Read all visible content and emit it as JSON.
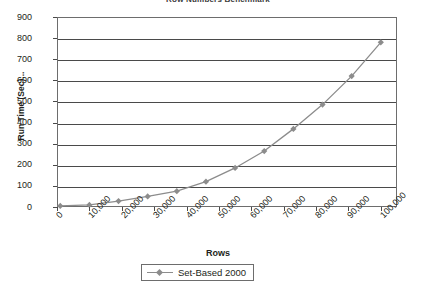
{
  "chart_data": {
    "type": "line",
    "title": "Row Numbers Benchmark",
    "xlabel": "Rows",
    "ylabel": "Run Time (Sec)...",
    "xlim": [
      0,
      105000
    ],
    "ylim": [
      0,
      900
    ],
    "grid": true,
    "legend_position": "bottom",
    "x_tick_labels": [
      "0",
      "10,000",
      "20,000",
      "30,000",
      "40,000",
      "50,000",
      "60,000",
      "70,000",
      "80,000",
      "90,000",
      "100,000"
    ],
    "x_tick_values": [
      0,
      10000,
      20000,
      30000,
      40000,
      50000,
      60000,
      70000,
      80000,
      90000,
      100000
    ],
    "y_tick_labels": [
      "0",
      "100",
      "200",
      "300",
      "400",
      "500",
      "600",
      "700",
      "800",
      "900"
    ],
    "y_tick_values": [
      0,
      100,
      200,
      300,
      400,
      500,
      600,
      700,
      800,
      900
    ],
    "series": [
      {
        "name": "Set-Based 2000",
        "color": "#8c8c8c",
        "marker": "diamond",
        "x": [
          1000,
          10000,
          19000,
          28000,
          37000,
          46000,
          55000,
          64000,
          73000,
          82000,
          91000,
          100000
        ],
        "values": [
          5,
          10,
          28,
          50,
          75,
          120,
          185,
          265,
          370,
          485,
          620,
          780
        ]
      }
    ]
  },
  "legend": {
    "entries": [
      {
        "label": "Set-Based 2000"
      }
    ]
  }
}
